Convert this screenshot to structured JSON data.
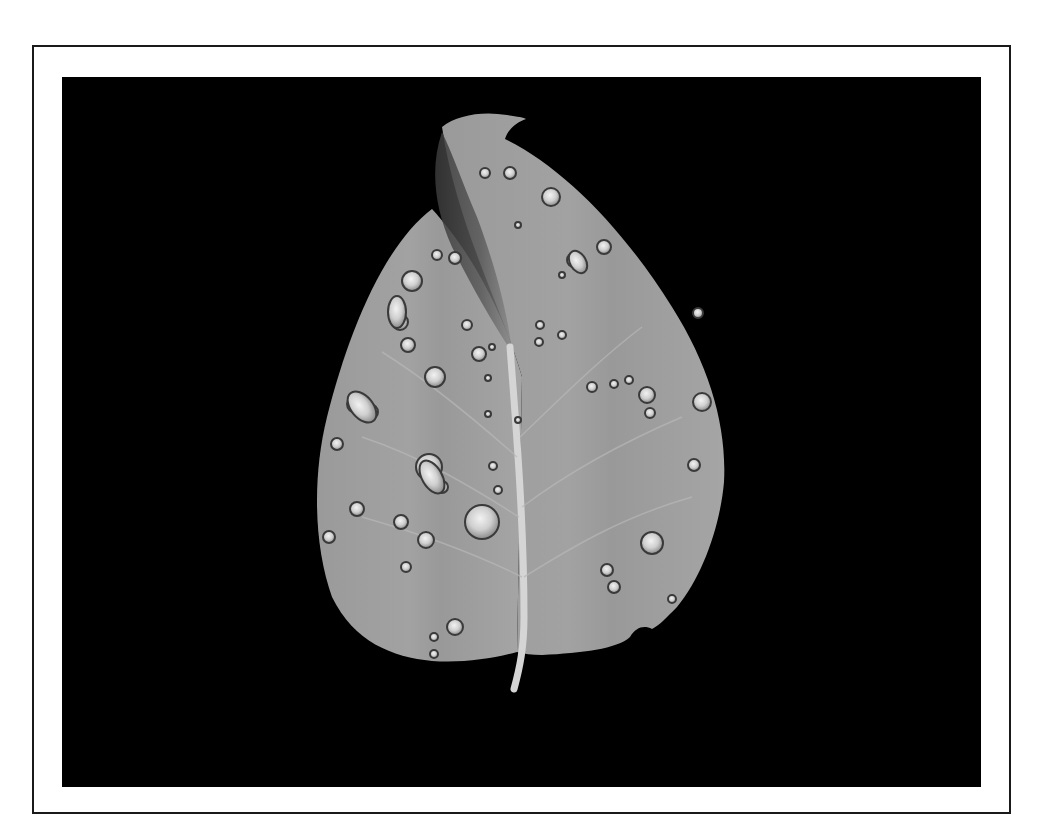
{
  "figure": {
    "style": "grayscale photograph",
    "colors": {
      "page_background": "#ffffff",
      "frame_border": "#1a1a1a",
      "photo_background": "#000000",
      "leaf_light": "#a8a8a8",
      "leaf_mid": "#8f8f8f",
      "leaf_dark_fold": "#4a4a4a",
      "stem": "#d8d8d8",
      "droplet_highlight": "#e6e6e6",
      "droplet_rim": "#3a3a3a"
    }
  }
}
